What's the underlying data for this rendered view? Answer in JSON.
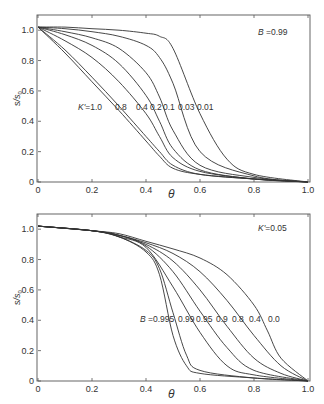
{
  "chart_data": [
    {
      "type": "line",
      "title": "",
      "xlabel": "θ",
      "ylabel": "s/s0",
      "xlim": [
        0,
        1.0
      ],
      "ylim": [
        0,
        1.1
      ],
      "xticks": [
        "0",
        "0.2",
        "0.4",
        "0.6",
        "0.8",
        "1.0"
      ],
      "yticks": [
        "0",
        "0.2",
        "0.4",
        "0.6",
        "0.8",
        "1.0"
      ],
      "grid": false,
      "annotation": "B =0.99",
      "curve_label_prefix": "K'=",
      "series_param": "K'",
      "series": [
        {
          "name": "1.0",
          "x": [
            0,
            0.1,
            0.2,
            0.3,
            0.4,
            0.45,
            0.5,
            0.6,
            0.8,
            1.0
          ],
          "values": [
            1.02,
            0.85,
            0.66,
            0.47,
            0.27,
            0.17,
            0.09,
            0.05,
            0.02,
            0.0
          ]
        },
        {
          "name": "0.8",
          "x": [
            0,
            0.1,
            0.2,
            0.3,
            0.4,
            0.45,
            0.5,
            0.6,
            0.8,
            1.0
          ],
          "values": [
            1.02,
            0.87,
            0.69,
            0.5,
            0.3,
            0.2,
            0.11,
            0.05,
            0.02,
            0.0
          ]
        },
        {
          "name": "0.4",
          "x": [
            0,
            0.1,
            0.2,
            0.3,
            0.4,
            0.45,
            0.5,
            0.6,
            0.8,
            1.0
          ],
          "values": [
            1.02,
            0.93,
            0.82,
            0.66,
            0.45,
            0.3,
            0.16,
            0.07,
            0.02,
            0.0
          ]
        },
        {
          "name": "0.2",
          "x": [
            0,
            0.1,
            0.2,
            0.3,
            0.4,
            0.45,
            0.5,
            0.6,
            0.8,
            1.0
          ],
          "values": [
            1.02,
            0.97,
            0.9,
            0.78,
            0.57,
            0.4,
            0.22,
            0.08,
            0.02,
            0.0
          ]
        },
        {
          "name": "0.1",
          "x": [
            0,
            0.1,
            0.2,
            0.3,
            0.4,
            0.45,
            0.5,
            0.6,
            0.8,
            1.0
          ],
          "values": [
            1.02,
            0.99,
            0.95,
            0.88,
            0.72,
            0.56,
            0.34,
            0.11,
            0.03,
            0.0
          ]
        },
        {
          "name": "0.03",
          "x": [
            0,
            0.1,
            0.2,
            0.3,
            0.4,
            0.45,
            0.5,
            0.6,
            0.8,
            1.0
          ],
          "values": [
            1.02,
            1.01,
            0.99,
            0.96,
            0.9,
            0.82,
            0.65,
            0.2,
            0.04,
            0.0
          ]
        },
        {
          "name": "0.01",
          "x": [
            0,
            0.1,
            0.2,
            0.3,
            0.4,
            0.45,
            0.5,
            0.6,
            0.7,
            0.8,
            1.0
          ],
          "values": [
            1.02,
            1.02,
            1.01,
            1.0,
            0.98,
            0.96,
            0.88,
            0.45,
            0.15,
            0.05,
            0.0
          ]
        }
      ]
    },
    {
      "type": "line",
      "title": "",
      "xlabel": "θ",
      "ylabel": "s/s0",
      "xlim": [
        0,
        1.0
      ],
      "ylim": [
        0,
        1.1
      ],
      "xticks": [
        "0",
        "0.2",
        "0.4",
        "0.6",
        "0.8",
        "1.0"
      ],
      "yticks": [
        "0",
        "0.2",
        "0.4",
        "0.6",
        "0.8",
        "1.0"
      ],
      "grid": false,
      "annotation": "K'=0.05",
      "curve_label_prefix": "B =",
      "series_param": "B",
      "series": [
        {
          "name": "0.995",
          "x": [
            0,
            0.2,
            0.3,
            0.4,
            0.45,
            0.5,
            0.55,
            0.6,
            0.8,
            1.0
          ],
          "values": [
            1.02,
            0.99,
            0.95,
            0.85,
            0.7,
            0.3,
            0.1,
            0.05,
            0.02,
            0.0
          ]
        },
        {
          "name": "0.99",
          "x": [
            0,
            0.2,
            0.3,
            0.4,
            0.45,
            0.5,
            0.55,
            0.6,
            0.8,
            1.0
          ],
          "values": [
            1.02,
            0.99,
            0.95,
            0.86,
            0.74,
            0.45,
            0.17,
            0.07,
            0.02,
            0.0
          ]
        },
        {
          "name": "0.95",
          "x": [
            0,
            0.2,
            0.3,
            0.4,
            0.5,
            0.6,
            0.7,
            0.8,
            1.0
          ],
          "values": [
            1.02,
            0.99,
            0.95,
            0.88,
            0.62,
            0.32,
            0.1,
            0.04,
            0.0
          ]
        },
        {
          "name": "0.9",
          "x": [
            0,
            0.2,
            0.3,
            0.4,
            0.5,
            0.6,
            0.7,
            0.8,
            1.0
          ],
          "values": [
            1.02,
            0.99,
            0.96,
            0.89,
            0.72,
            0.46,
            0.22,
            0.07,
            0.0
          ]
        },
        {
          "name": "0.8",
          "x": [
            0,
            0.2,
            0.3,
            0.4,
            0.5,
            0.6,
            0.7,
            0.8,
            0.9,
            1.0
          ],
          "values": [
            1.02,
            0.99,
            0.96,
            0.9,
            0.79,
            0.6,
            0.36,
            0.15,
            0.05,
            0.0
          ]
        },
        {
          "name": "0.4",
          "x": [
            0,
            0.2,
            0.3,
            0.4,
            0.5,
            0.6,
            0.7,
            0.8,
            0.9,
            1.0
          ],
          "values": [
            1.02,
            0.99,
            0.96,
            0.91,
            0.84,
            0.72,
            0.53,
            0.3,
            0.1,
            0.0
          ]
        },
        {
          "name": "0.0",
          "x": [
            0,
            0.2,
            0.3,
            0.4,
            0.5,
            0.6,
            0.7,
            0.8,
            0.85,
            0.9,
            1.0
          ],
          "values": [
            1.02,
            0.99,
            0.97,
            0.92,
            0.87,
            0.81,
            0.7,
            0.5,
            0.33,
            0.15,
            0.0
          ]
        }
      ]
    }
  ],
  "panels": {
    "top": {
      "annotation_italic": "B",
      "annotation_rest": " =0.99",
      "curve_labels": [
        {
          "italic": "K'",
          "text": "=1.0"
        },
        {
          "text": "0.8"
        },
        {
          "text": "0.4"
        },
        {
          "text": "0.2"
        },
        {
          "text": "0.1"
        },
        {
          "text": "0.03"
        },
        {
          "text": "0.01"
        }
      ]
    },
    "bottom": {
      "annotation_italic": "K'",
      "annotation_rest": "=0.05",
      "curve_labels": [
        {
          "italic": "B",
          "text": " =0.995"
        },
        {
          "text": "0.99"
        },
        {
          "text": "0.95"
        },
        {
          "text": "0.9"
        },
        {
          "text": "0.8"
        },
        {
          "text": "0.4"
        },
        {
          "text": "0.0"
        }
      ]
    }
  }
}
